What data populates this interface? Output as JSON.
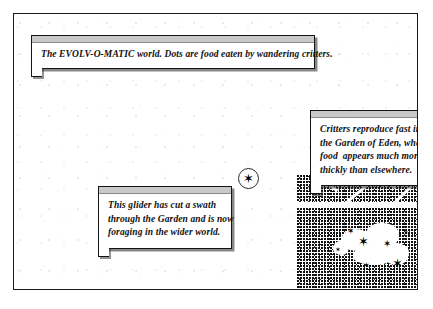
{
  "figure": {
    "title": "The EVOLV-O-MATIC world",
    "frame_color": "#1a1a1a",
    "background_color": "#ffffff"
  },
  "callouts": [
    {
      "id": "world",
      "name": "callout-world-description",
      "lines": [
        "The EVOLV-O-MATIC world. Dots are food eaten by wandering critters."
      ]
    },
    {
      "id": "eden",
      "name": "callout-garden-of-eden",
      "lines": [
        "Critters reproduce fast in",
        "the Garden of Eden, where",
        "food  appears much more",
        "thickly than elsewhere."
      ]
    },
    {
      "id": "glider",
      "name": "callout-glider",
      "lines": [
        "This glider has cut a swath",
        "through the Garden and is now",
        "foraging in the wider world."
      ]
    }
  ],
  "world": {
    "food_field_label": "scattered food dots",
    "garden_of_eden_label": "Garden of Eden dense food region",
    "glider_marker": {
      "label": "circled glider critter",
      "glyph": "✶"
    },
    "critter_glyph": "✶",
    "critters": [
      {
        "x": 50,
        "y": 58,
        "size": 9
      },
      {
        "x": 61,
        "y": 66,
        "size": 13
      },
      {
        "x": 86,
        "y": 70,
        "size": 10
      },
      {
        "x": 95,
        "y": 88,
        "size": 13
      },
      {
        "x": 66,
        "y": 93,
        "size": 8
      },
      {
        "x": 106,
        "y": 61,
        "size": 7
      },
      {
        "x": 38,
        "y": 78,
        "size": 7
      }
    ],
    "swaths": [
      {
        "x": 10,
        "y": 10,
        "length": 34,
        "thickness": 3,
        "angle": 38
      },
      {
        "x": 44,
        "y": 24,
        "length": 30,
        "thickness": 3,
        "angle": -40
      },
      {
        "x": 72,
        "y": 8,
        "length": 30,
        "thickness": 3,
        "angle": 40
      },
      {
        "x": 90,
        "y": 26,
        "length": 28,
        "thickness": 3,
        "angle": -44
      },
      {
        "x": 96,
        "y": 4,
        "length": 30,
        "thickness": 2.5,
        "angle": 52
      }
    ],
    "eaten_blobs": [
      {
        "x": 44,
        "y": 60,
        "w": 30,
        "h": 22
      },
      {
        "x": 68,
        "y": 54,
        "w": 34,
        "h": 26
      },
      {
        "x": 56,
        "y": 76,
        "w": 40,
        "h": 20
      },
      {
        "x": 86,
        "y": 74,
        "w": 26,
        "h": 22
      },
      {
        "x": 36,
        "y": 72,
        "w": 16,
        "h": 14
      }
    ]
  }
}
